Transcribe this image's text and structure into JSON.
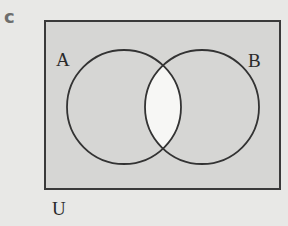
{
  "part_label": "c",
  "diagram": {
    "type": "venn",
    "universal_label": "U",
    "sets": [
      {
        "label": "A",
        "cx": 124,
        "cy": 107,
        "r": 57
      },
      {
        "label": "B",
        "cx": 202,
        "cy": 107,
        "r": 57
      }
    ],
    "shaded_region": "complement of (A ∩ B)",
    "colors": {
      "shade": "#d6d6d4",
      "unshaded": "#f7f7f5",
      "stroke": "#333333",
      "background": "#e8e8e6"
    }
  }
}
